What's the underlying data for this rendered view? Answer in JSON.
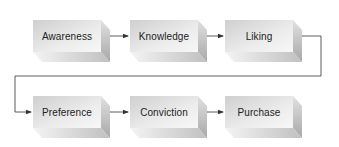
{
  "diagram": {
    "type": "flow",
    "title": "",
    "row1": [
      {
        "id": "awareness",
        "label": "Awareness",
        "x": 33,
        "y": 20
      },
      {
        "id": "knowledge",
        "label": "Knowledge",
        "x": 130,
        "y": 20
      },
      {
        "id": "liking",
        "label": "Liking",
        "x": 225,
        "y": 20
      }
    ],
    "row2": [
      {
        "id": "preference",
        "label": "Preference",
        "x": 33,
        "y": 96
      },
      {
        "id": "conviction",
        "label": "Conviction",
        "x": 130,
        "y": 96
      },
      {
        "id": "purchase",
        "label": "Purchase",
        "x": 225,
        "y": 96
      }
    ],
    "edges": [
      {
        "from": "awareness",
        "to": "knowledge"
      },
      {
        "from": "knowledge",
        "to": "liking"
      },
      {
        "from": "liking",
        "to": "preference"
      },
      {
        "from": "preference",
        "to": "conviction"
      },
      {
        "from": "conviction",
        "to": "purchase"
      }
    ],
    "colors": {
      "face_light": "#f2f2f2",
      "face_dark": "#c8c8c8",
      "side": "#b4b4b4",
      "bottom": "#d6d6d6",
      "line": "#333333",
      "text": "#222222"
    }
  }
}
